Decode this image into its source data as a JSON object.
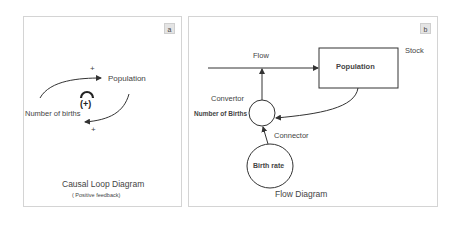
{
  "panel_a": {
    "badge": "a",
    "nodes": {
      "population": "Population",
      "births": "Number of births"
    },
    "polarity_top": "+",
    "polarity_bottom": "+",
    "loop_sign": "(+)",
    "title": "Causal Loop Diagram",
    "subtitle": "( Positive feedback)"
  },
  "panel_b": {
    "badge": "b",
    "flow_label": "Flow",
    "stock_box": "Population",
    "stock_label": "Stock",
    "convertor_label": "Convertor",
    "convertor_name": "Number of Births",
    "connector_label": "Connector",
    "birth_rate": "Birth rate",
    "title": "Flow Diagram"
  },
  "colors": {
    "line": "#333333",
    "border": "#d4d4d4",
    "badge_bg": "#e4e4e4"
  }
}
